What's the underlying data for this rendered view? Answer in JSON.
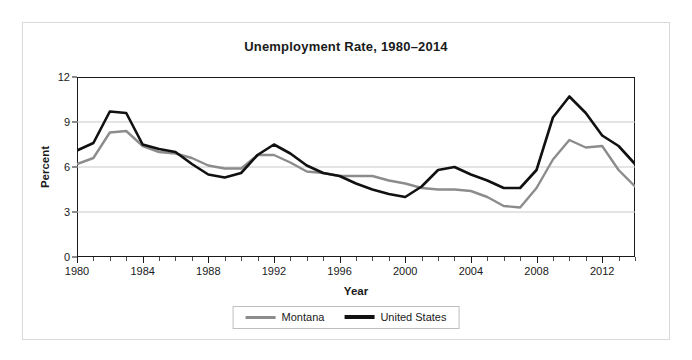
{
  "chart_data": {
    "type": "line",
    "title": "Unemployment Rate, 1980–2014",
    "xlabel": "Year",
    "ylabel": "Percent",
    "xlim": [
      1980,
      2014
    ],
    "ylim": [
      0,
      12
    ],
    "yticks": [
      0,
      3,
      6,
      9,
      12
    ],
    "xticks": [
      1980,
      1984,
      1988,
      1992,
      1996,
      2000,
      2004,
      2008,
      2012
    ],
    "grid": "horizontal",
    "legend_position": "bottom-center",
    "x": [
      1980,
      1981,
      1982,
      1983,
      1984,
      1985,
      1986,
      1987,
      1988,
      1989,
      1990,
      1991,
      1992,
      1993,
      1994,
      1995,
      1996,
      1997,
      1998,
      1999,
      2000,
      2001,
      2002,
      2003,
      2004,
      2005,
      2006,
      2007,
      2008,
      2009,
      2010,
      2011,
      2012,
      2013,
      2014
    ],
    "series": [
      {
        "name": "Montana",
        "color": "#8c8c8c",
        "values": [
          6.2,
          6.6,
          8.3,
          8.4,
          7.4,
          7.0,
          6.9,
          6.6,
          6.1,
          5.9,
          5.9,
          6.8,
          6.8,
          6.3,
          5.7,
          5.6,
          5.4,
          5.4,
          5.4,
          5.1,
          4.9,
          4.6,
          4.5,
          4.5,
          4.4,
          4.0,
          3.4,
          3.3,
          4.6,
          6.5,
          7.8,
          7.3,
          7.4,
          5.8,
          4.7
        ]
      },
      {
        "name": "United States",
        "color": "#111111",
        "values": [
          7.1,
          7.6,
          9.7,
          9.6,
          7.5,
          7.2,
          7.0,
          6.2,
          5.5,
          5.3,
          5.6,
          6.8,
          7.5,
          6.9,
          6.1,
          5.6,
          5.4,
          4.9,
          4.5,
          4.2,
          4.0,
          4.7,
          5.8,
          6.0,
          5.5,
          5.1,
          4.6,
          4.6,
          5.8,
          9.3,
          10.7,
          9.6,
          8.1,
          7.4,
          6.2
        ]
      }
    ]
  },
  "legend": {
    "entries": [
      {
        "label": "Montana"
      },
      {
        "label": "United States"
      }
    ]
  }
}
